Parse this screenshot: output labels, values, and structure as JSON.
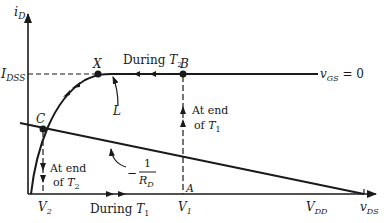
{
  "diagram": {
    "type": "JFET drain characteristic with load line",
    "axes": {
      "y_label_main": "i",
      "y_label_sub": "D",
      "x_label_main": "v",
      "x_label_sub": "DS"
    },
    "levels": {
      "idss_main": "I",
      "idss_sub": "DSS"
    },
    "curve": {
      "label_main": "v",
      "label_sub": "GS",
      "label_suffix": " = 0",
      "inductor_label": "L"
    },
    "points": {
      "x": "X",
      "b": "B",
      "c": "C",
      "a": "A"
    },
    "ticks": {
      "v2_main": "V",
      "v2_sub": "2",
      "v1_main": "V",
      "v1_sub": "1",
      "vdd_main": "V",
      "vdd_sub": "DD"
    },
    "annotations": {
      "during_t2_prefix": "During ",
      "during_t2_main": "T",
      "during_t2_sub": "2",
      "during_t1_prefix": "During ",
      "during_t1_main": "T",
      "during_t1_sub": "1",
      "end_t1_line1": "At end",
      "end_t1_line2_prefix": "of ",
      "end_t1_main": "T",
      "end_t1_sub": "1",
      "end_t2_line1": "At end",
      "end_t2_line2_prefix": "of ",
      "end_t2_main": "T",
      "end_t2_sub": "2",
      "slope_minus": "−",
      "slope_num": "1",
      "slope_den_main": "R",
      "slope_den_sub": "D"
    }
  }
}
